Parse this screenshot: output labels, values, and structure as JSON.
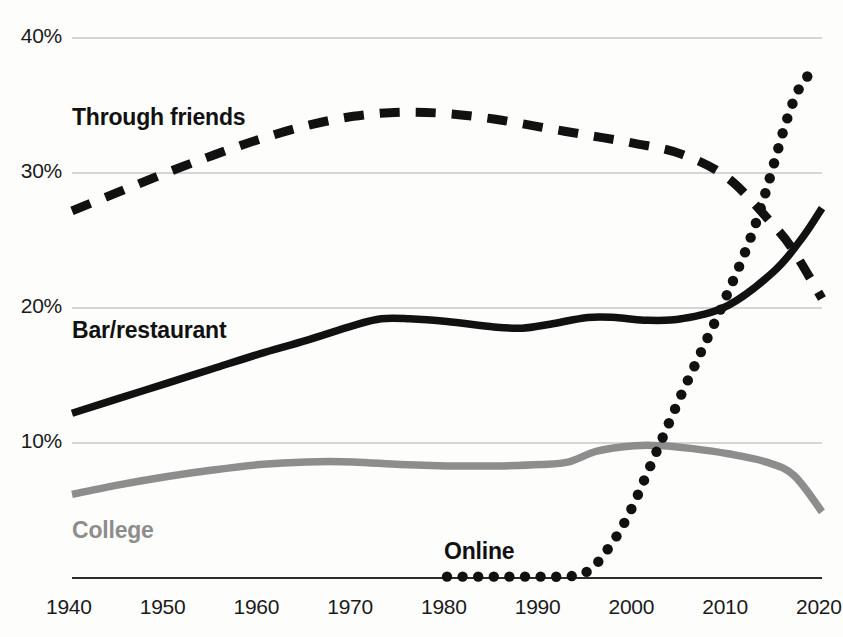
{
  "chart_data": {
    "type": "line",
    "title": "",
    "subtitle": "",
    "xlabel": "",
    "ylabel": "",
    "xlim": [
      1940,
      2020
    ],
    "ylim": [
      0,
      40
    ],
    "grid": true,
    "legend_position": "inline-labels",
    "y_ticks": [
      "10%",
      "20%",
      "30%",
      "40%"
    ],
    "y_tick_values": [
      10,
      20,
      30,
      40
    ],
    "x_ticks": [
      "1940",
      "1950",
      "1960",
      "1970",
      "1980",
      "1990",
      "2000",
      "2010",
      "2020"
    ],
    "x_tick_values": [
      1940,
      1950,
      1960,
      1970,
      1980,
      1990,
      2000,
      2010,
      2020
    ],
    "colors": {
      "through_friends": "#111111",
      "bar_restaurant": "#111111",
      "college": "#8d8d8d",
      "online": "#111111",
      "grid": "#c9c9c9",
      "axis": "#2b2b2b"
    },
    "series": [
      {
        "name": "Through friends",
        "style": "dashed",
        "color": "#111111",
        "x": [
          1940,
          1945,
          1950,
          1955,
          1960,
          1965,
          1970,
          1975,
          1980,
          1985,
          1990,
          1995,
          2000,
          2005,
          2010,
          2015,
          2017,
          2020
        ],
        "values": [
          27.2,
          28.6,
          30.0,
          31.3,
          32.5,
          33.5,
          34.2,
          34.5,
          34.4,
          34.0,
          33.4,
          32.8,
          32.2,
          31.4,
          29.6,
          26.0,
          24.2,
          20.7
        ]
      },
      {
        "name": "Bar/restaurant",
        "style": "solid",
        "color": "#111111",
        "x": [
          1940,
          1945,
          1950,
          1955,
          1960,
          1965,
          1970,
          1973,
          1976,
          1980,
          1985,
          1988,
          1991,
          1995,
          1998,
          2001,
          2005,
          2010,
          2015,
          2018,
          2020
        ],
        "values": [
          12.2,
          13.3,
          14.4,
          15.5,
          16.6,
          17.6,
          18.7,
          19.2,
          19.2,
          19.0,
          18.6,
          18.5,
          18.8,
          19.3,
          19.3,
          19.1,
          19.2,
          20.2,
          22.8,
          25.3,
          27.4
        ]
      },
      {
        "name": "College",
        "style": "solid",
        "color": "#8d8d8d",
        "x": [
          1940,
          1945,
          1950,
          1955,
          1960,
          1965,
          1970,
          1975,
          1980,
          1985,
          1990,
          1993,
          1996,
          2000,
          2003,
          2006,
          2010,
          2014,
          2017,
          2020
        ],
        "values": [
          6.2,
          6.9,
          7.5,
          8.0,
          8.4,
          8.6,
          8.6,
          8.4,
          8.3,
          8.3,
          8.4,
          8.6,
          9.4,
          9.8,
          9.8,
          9.6,
          9.2,
          8.6,
          7.6,
          4.9
        ]
      },
      {
        "name": "Online",
        "style": "dotted",
        "color": "#111111",
        "x": [
          1980,
          1982,
          1984,
          1986,
          1988,
          1990,
          1992,
          1994,
          1995,
          1996,
          1997,
          1998,
          1999,
          2000,
          2001,
          2002,
          2003,
          2004,
          2005,
          2006,
          2007,
          2008,
          2009,
          2010,
          2011,
          2012,
          2013,
          2014,
          2015,
          2016,
          2017,
          2018,
          2019
        ],
        "values": [
          0.1,
          0.1,
          0.1,
          0.1,
          0.1,
          0.1,
          0.1,
          0.2,
          0.5,
          1.1,
          2.0,
          3.0,
          4.2,
          5.6,
          7.2,
          8.8,
          10.4,
          12.0,
          13.6,
          15.1,
          16.6,
          18.1,
          19.6,
          21.2,
          22.8,
          24.5,
          26.4,
          28.6,
          31.0,
          33.4,
          35.4,
          36.8,
          37.5
        ]
      }
    ],
    "inline_labels": [
      {
        "text": "Through friends",
        "color": "#111111",
        "x_px": 72,
        "y_px": 104
      },
      {
        "text": "Bar/restaurant",
        "color": "#111111",
        "x_px": 72,
        "y_px": 317
      },
      {
        "text": "College",
        "color": "#8d8d8d",
        "x_px": 72,
        "y_px": 517
      },
      {
        "text": "Online",
        "color": "#111111",
        "x_px": 444,
        "y_px": 538
      }
    ]
  }
}
